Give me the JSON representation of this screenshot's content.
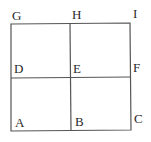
{
  "diagram": {
    "type": "grid-2x2",
    "line_color": "#555555",
    "text_color": "#2a2a2a",
    "points": [
      {
        "name": "G",
        "x": 11,
        "y": 24
      },
      {
        "name": "H",
        "x": 70,
        "y": 24
      },
      {
        "name": "I",
        "x": 130,
        "y": 23
      },
      {
        "name": "D",
        "x": 11,
        "y": 78
      },
      {
        "name": "E",
        "x": 70,
        "y": 78
      },
      {
        "name": "F",
        "x": 131,
        "y": 77
      },
      {
        "name": "A",
        "x": 11,
        "y": 131
      },
      {
        "name": "B",
        "x": 70,
        "y": 131
      },
      {
        "name": "C",
        "x": 130,
        "y": 130
      }
    ],
    "labels": {
      "G": "G",
      "H": "H",
      "I": "I",
      "D": "D",
      "E": "E",
      "F": "F",
      "A": "A",
      "B": "B",
      "C": "C"
    }
  }
}
